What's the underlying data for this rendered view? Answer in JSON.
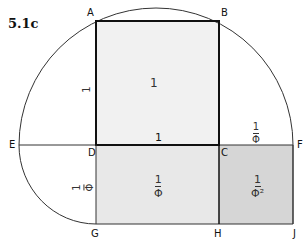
{
  "title": "5.1c",
  "points": {
    "A": "A",
    "B": "B",
    "C": "C",
    "D": "D",
    "E": "E",
    "F": "F",
    "G": "G",
    "H": "H",
    "J": "J"
  },
  "labels": {
    "square_area": "1",
    "side_AD": "1",
    "side_DC": "1",
    "segment_CF": {
      "num": "1",
      "den": "Φ"
    },
    "side_DG": {
      "num": "1",
      "den": "Φ"
    },
    "rect_DGHC_area": {
      "num": "1",
      "den": "Φ"
    },
    "rect_CHJF_area": {
      "num": "1",
      "den": "Φ²"
    }
  },
  "colors": {
    "square_fill": "#f1f1f1",
    "rect_fill": "#e6e6e6",
    "small_rect_fill": "#d6d6d6",
    "line": "#222222"
  }
}
